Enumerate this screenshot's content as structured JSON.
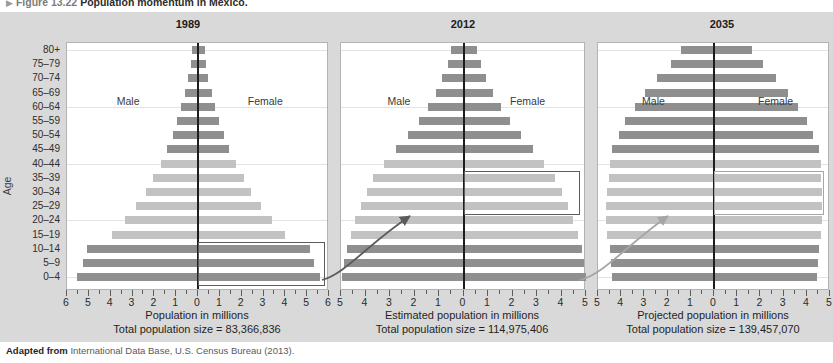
{
  "figure": {
    "number": "Figure 13.22",
    "title": "Population momentum in Mexico.",
    "source_prefix": "Adapted from",
    "source_text": "International Data Base, U.S. Census Bureau (2013)."
  },
  "axis": {
    "age_title": "Age",
    "age_groups": [
      "80+",
      "75–79",
      "70–74",
      "65–69",
      "60–64",
      "55–59",
      "50–54",
      "45–49",
      "40–44",
      "35–39",
      "30–34",
      "25–29",
      "20–24",
      "15–19",
      "10–14",
      "5–9",
      "0–4"
    ]
  },
  "legend": {
    "male": "Male",
    "female": "Female"
  },
  "colors": {
    "bar_dark": "#8f8f8f",
    "bar_light": "#c2c2c2",
    "panel_bg": "#d9d9d9",
    "center_axis": "#1d1d1d",
    "highlight_dark": "#5c5c5c",
    "highlight_light": "#a6a6a6"
  },
  "chart_data": {
    "type": "bar",
    "chart_kind": "population-pyramid",
    "title": "Population momentum in Mexico.",
    "ylabel": "Age",
    "grid": true,
    "legend_position": "in-plot",
    "categories": [
      "80+",
      "75–79",
      "70–74",
      "65–69",
      "60–64",
      "55–59",
      "50–54",
      "45–49",
      "40–44",
      "35–39",
      "30–34",
      "25–29",
      "20–24",
      "15–19",
      "10–14",
      "5–9",
      "0–4"
    ],
    "panels": [
      {
        "year": "1989",
        "xlabel": "Population in millions",
        "total_label": "Total population size = 83,366,836",
        "total_population": 83366836,
        "xlim": [
          -6,
          6
        ],
        "xticks": [
          6,
          5,
          4,
          3,
          2,
          1,
          0,
          1,
          2,
          3,
          4,
          5,
          6
        ],
        "series": [
          {
            "name": "Male",
            "values": [
              0.28,
              0.33,
              0.45,
              0.6,
              0.78,
              0.95,
              1.15,
              1.4,
              1.7,
              2.05,
              2.4,
              2.85,
              3.35,
              3.95,
              5.1,
              5.25,
              5.55
            ]
          },
          {
            "name": "Female",
            "values": [
              0.3,
              0.35,
              0.47,
              0.62,
              0.8,
              0.98,
              1.18,
              1.44,
              1.74,
              2.1,
              2.45,
              2.9,
              3.4,
              4.0,
              5.15,
              5.3,
              5.6
            ]
          }
        ],
        "shade": [
          "dark",
          "dark",
          "dark",
          "dark",
          "dark",
          "dark",
          "dark",
          "dark",
          "light",
          "light",
          "light",
          "light",
          "light",
          "light",
          "dark",
          "dark",
          "dark"
        ],
        "highlight_group": "0–4 to 10–14 (female)",
        "highlight_style": "dark"
      },
      {
        "year": "2012",
        "xlabel": "Estimated population in millions",
        "total_label": "Total population size = 114,975,406",
        "total_population": 114975406,
        "xlim": [
          -5.5,
          5.5
        ],
        "xticks": [
          5,
          4,
          3,
          2,
          1,
          0,
          1,
          2,
          3,
          4,
          5
        ],
        "series": [
          {
            "name": "Male",
            "values": [
              0.55,
              0.7,
              0.95,
              1.25,
              1.6,
              2.0,
              2.5,
              3.05,
              3.55,
              4.05,
              4.35,
              4.6,
              4.85,
              5.05,
              5.25,
              5.35,
              5.45
            ]
          },
          {
            "name": "Female",
            "values": [
              0.62,
              0.78,
              1.02,
              1.32,
              1.68,
              2.08,
              2.58,
              3.12,
              3.62,
              4.12,
              4.42,
              4.68,
              4.92,
              5.12,
              5.3,
              5.4,
              5.5
            ]
          }
        ],
        "shade": [
          "dark",
          "dark",
          "dark",
          "dark",
          "dark",
          "dark",
          "dark",
          "dark",
          "light",
          "light",
          "light",
          "light",
          "light",
          "light",
          "dark",
          "dark",
          "dark"
        ],
        "highlight_group": "25–29 to 35–39 (female)",
        "highlight_style": "dark"
      },
      {
        "year": "2035",
        "xlabel": "Projected population in millions",
        "total_label": "Total population size = 139,457,070",
        "total_population": 139457070,
        "xlim": [
          -5.5,
          5.5
        ],
        "xticks": [
          5,
          4,
          3,
          2,
          1,
          0,
          1,
          2,
          3,
          4,
          5
        ],
        "series": [
          {
            "name": "Male",
            "values": [
              1.55,
              2.05,
              2.7,
              3.25,
              3.75,
              4.2,
              4.5,
              4.85,
              4.95,
              5.0,
              5.05,
              5.1,
              5.1,
              5.05,
              4.95,
              4.9,
              4.85
            ]
          },
          {
            "name": "Female",
            "values": [
              1.8,
              2.3,
              2.95,
              3.5,
              4.0,
              4.4,
              4.68,
              5.0,
              5.05,
              5.08,
              5.1,
              5.12,
              5.12,
              5.08,
              4.98,
              4.92,
              4.88
            ]
          }
        ],
        "shade": [
          "dark",
          "dark",
          "dark",
          "dark",
          "dark",
          "dark",
          "dark",
          "dark",
          "light",
          "light",
          "light",
          "light",
          "light",
          "light",
          "dark",
          "dark",
          "dark"
        ],
        "highlight_group": "25–29 to 35–39 (female)",
        "highlight_style": "light"
      }
    ],
    "annotations": [
      {
        "type": "arrow",
        "from_panel": "1989",
        "to_panel": "2012",
        "style": "dark"
      },
      {
        "type": "arrow",
        "from_panel": "2012",
        "to_panel": "2035",
        "style": "light"
      }
    ]
  }
}
